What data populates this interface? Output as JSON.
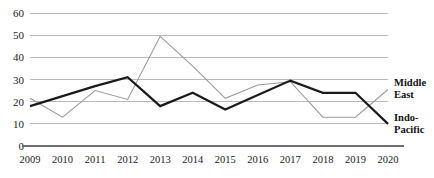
{
  "chart_data": {
    "type": "line",
    "title": "",
    "subtitle": "",
    "xlabel": "",
    "ylabel": "",
    "categories": [
      "2009",
      "2010",
      "2011",
      "2012",
      "2013",
      "2014",
      "2015",
      "2016",
      "2017",
      "2018",
      "2019",
      "2020"
    ],
    "x": [
      2009,
      2010,
      2011,
      2012,
      2013,
      2014,
      2015,
      2016,
      2017,
      2018,
      2019,
      2020
    ],
    "xlim": [
      2009,
      2020
    ],
    "ylim": [
      0,
      60
    ],
    "yticks": [
      0,
      10,
      20,
      30,
      40,
      50,
      60
    ],
    "ytick_labels": [
      "0",
      "10",
      "20",
      "30",
      "40",
      "50",
      "60"
    ],
    "grid": true,
    "grid_axis": "y",
    "legend": "inline-right-end-labels",
    "series": [
      {
        "name": "Indo-Pacific",
        "label_lines": [
          "Indo-",
          "Pacific"
        ],
        "color": "#1a1a1a",
        "line_width": 2.2,
        "values": [
          18,
          22.5,
          27,
          31,
          18,
          24,
          16.5,
          23,
          29.5,
          24,
          24,
          10
        ]
      },
      {
        "name": "Middle East",
        "label_lines": [
          "Middle",
          "East"
        ],
        "color": "#9a9a9a",
        "line_width": 1.1,
        "values": [
          21.5,
          13,
          25,
          21,
          49.5,
          36,
          21.5,
          27.5,
          29,
          13,
          13,
          25.5
        ]
      }
    ],
    "annotations": []
  },
  "colors": {
    "background": "#ffffff",
    "grid": "#a9a9a9",
    "axis": "#6e6e6e",
    "indo_pacific": "#1a1a1a",
    "middle_east": "#9a9a9a",
    "text": "#1a1a1a"
  }
}
